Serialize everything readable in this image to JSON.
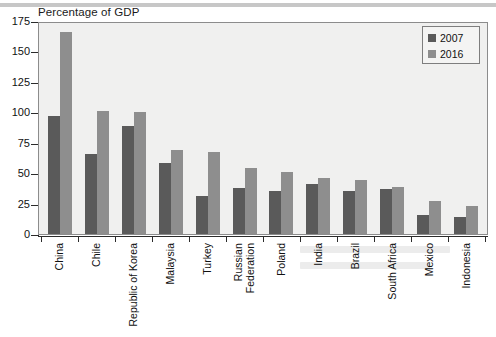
{
  "chart_data": {
    "type": "bar",
    "title": "",
    "axis_title": "Percentage of GDP",
    "xlabel": "",
    "ylabel": "Percentage of GDP",
    "ylim": [
      0,
      175
    ],
    "yticks": [
      0,
      25,
      50,
      75,
      100,
      125,
      150,
      175
    ],
    "grid": false,
    "legend_position": "top-right",
    "categories": [
      "China",
      "Chile",
      "Republic of Korea",
      "Malaysia",
      "Turkey",
      "Russian\nFederation",
      "Poland",
      "India",
      "Brazil",
      "South Africa",
      "Mexico",
      "Indonesia"
    ],
    "series": [
      {
        "name": "2007",
        "color": "#5a5a5a",
        "values": [
          97,
          66,
          89,
          58,
          31,
          38,
          35,
          41,
          35,
          37,
          16,
          14
        ]
      },
      {
        "name": "2016",
        "color": "#8e8e8e",
        "values": [
          166,
          101,
          100,
          69,
          67,
          54,
          51,
          46,
          44,
          39,
          27,
          23
        ]
      }
    ]
  },
  "legend": {
    "items": [
      {
        "label": "2007",
        "series": "s0"
      },
      {
        "label": "2016",
        "series": "s1"
      }
    ]
  },
  "colors": {
    "series_2007": "#5a5a5a",
    "series_2016": "#8e8e8e",
    "plot_background": "#f0f0ef",
    "axis": "#2b2b2b"
  }
}
